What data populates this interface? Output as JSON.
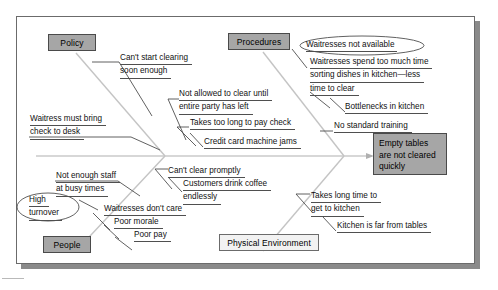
{
  "diagram": {
    "type": "fishbone-ishikawa",
    "effect": {
      "label": "Empty tables are not cleared quickly",
      "line1": "Empty tables",
      "line2": "are not cleared",
      "line3": "quickly"
    },
    "categories": [
      {
        "id": "policy",
        "label": "Policy",
        "position": "top-left",
        "style": "gray"
      },
      {
        "id": "procedures",
        "label": "Procedures",
        "position": "top-right",
        "style": "gray"
      },
      {
        "id": "people",
        "label": "People",
        "position": "bottom-left",
        "style": "gray"
      },
      {
        "id": "physical-environment",
        "label": "Physical Environment",
        "position": "bottom-right",
        "style": "light"
      }
    ],
    "causes": {
      "policy": [
        {
          "id": "cant-start-clearing",
          "line1": "Can't start clearing",
          "line2": "soon enough"
        },
        {
          "id": "waitress-must-bring-check",
          "line1": "Waitress must bring",
          "line2": "check to desk"
        }
      ],
      "procedures": [
        {
          "id": "waitresses-not-available",
          "line1": "Waitresses not available",
          "highlight": "ellipse"
        },
        {
          "id": "waitresses-sorting-dishes",
          "line1": "Waitresses spend too much time",
          "line2": "sorting dishes in kitchen—less",
          "line3": "time to clear"
        },
        {
          "id": "bottlenecks-in-kitchen",
          "line1": "Bottlenecks in kitchen"
        },
        {
          "id": "no-standard-training",
          "line1": "No standard training"
        },
        {
          "id": "not-allowed-to-clear",
          "line1": "Not allowed to clear until",
          "line2": "entire party has left"
        },
        {
          "id": "takes-too-long-to-pay-check",
          "line1": "Takes too long to pay check"
        },
        {
          "id": "credit-card-machine-jams",
          "line1": "Credit card machine jams"
        }
      ],
      "people": [
        {
          "id": "not-enough-staff",
          "line1": "Not enough staff",
          "line2": "at busy times"
        },
        {
          "id": "high-turnover",
          "line1": "High",
          "line2": "turnover",
          "highlight": "ellipse"
        },
        {
          "id": "waitresses-dont-care",
          "line1": "Waitresses don't care"
        },
        {
          "id": "poor-morale",
          "line1": "Poor morale"
        },
        {
          "id": "poor-pay",
          "line1": "Poor pay"
        }
      ],
      "physical-environment": [
        {
          "id": "cant-clear-promptly",
          "line1": "Can't clear promptly"
        },
        {
          "id": "customers-drink-coffee",
          "line1": "Customers drink coffee",
          "line2": "endlessly"
        },
        {
          "id": "takes-long-time-to-get-to-kitchen",
          "line1": "Takes long time to",
          "line2": "get to kitchen"
        },
        {
          "id": "kitchen-is-far-from-tables",
          "line1": "Kitchen is far from tables"
        }
      ]
    },
    "colors": {
      "category_fill": "#a6a6a6",
      "category_light_fill": "#f2f2f2",
      "effect_fill": "#a6a6a6",
      "line": "#4f4f4f",
      "spine": "#b0b0b0",
      "frame": "#6b6b6b",
      "shadow": "#8a8a8a"
    }
  }
}
